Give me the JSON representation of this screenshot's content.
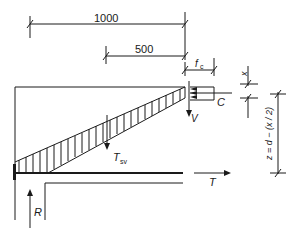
{
  "diagram": {
    "type": "strut-and-tie / shear model of cantilever slab",
    "dimensions": {
      "overall": "1000",
      "partial": "500",
      "fc_label": "f",
      "fc_sub": "c",
      "x_label": "x",
      "lever_arm": "z = d − (x / 2)"
    },
    "forces": {
      "compression": "C",
      "shear": "V",
      "stirrup_tension": "T",
      "stirrup_sub": "sv",
      "tension": "T",
      "reaction": "R"
    },
    "colors": {
      "line": "#1a1a1a",
      "background": "#ffffff"
    }
  }
}
